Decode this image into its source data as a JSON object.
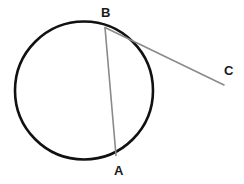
{
  "figure": {
    "background_color": "#ffffff",
    "width": 244,
    "height": 184
  },
  "labels": {
    "point_a": "A",
    "point_b": "B",
    "point_c": "C"
  },
  "colors": {
    "circle_stroke": "#111111",
    "chord_stroke": "#8a8a8a",
    "secant_stroke": "#8a8a8a",
    "label_text": "#1a1a1a"
  },
  "geometry": {
    "circle": {
      "center_x": 84,
      "center_y": 90.5,
      "radius": 69,
      "stroke_width": 2.6
    },
    "points": {
      "A": {
        "x": 116,
        "y": 155.5
      },
      "B": {
        "x": 105,
        "y": 27.5
      },
      "C": {
        "x": 224,
        "y": 85
      }
    },
    "segments": [
      {
        "name": "chord-AB",
        "from": "B",
        "to": "A",
        "stroke_width": 1.6
      },
      {
        "name": "line-BC",
        "from": "B",
        "to": "C",
        "stroke_width": 1.6
      }
    ]
  }
}
